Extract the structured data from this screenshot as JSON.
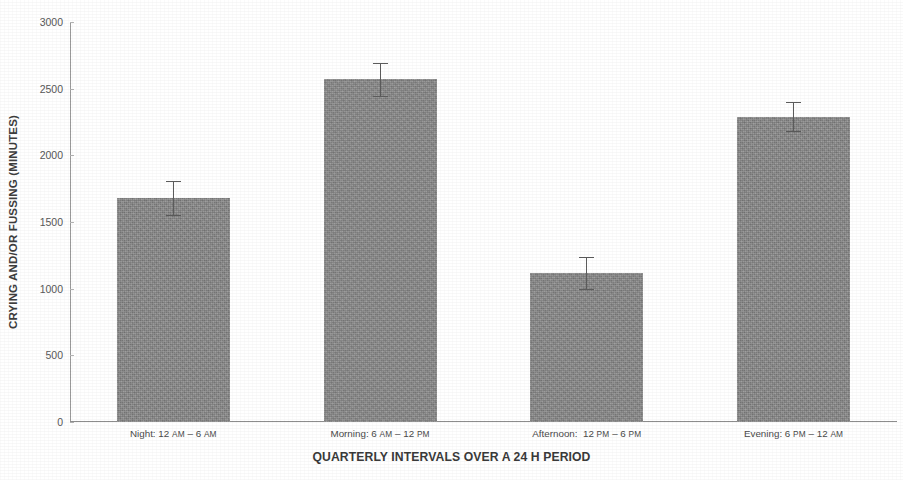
{
  "chart_data": {
    "type": "bar",
    "title": "",
    "xlabel": "QUARTERLY INTERVALS OVER A 24 H PERIOD",
    "ylabel": "CRYING AND/OR FUSSING (MINUTES)",
    "categories": [
      "Night: 12 AM – 6 AM",
      "Morning: 6 AM – 12 PM",
      "Afternoon:  12 PM – 6 PM",
      "Evening: 6 PM – 12 AM"
    ],
    "category_parts": [
      {
        "lead": "Night: 12 ",
        "u1": "AM",
        "mid": " – 6 ",
        "u2": "AM"
      },
      {
        "lead": "Morning: 6 ",
        "u1": "AM",
        "mid": " – 12 ",
        "u2": "PM"
      },
      {
        "lead": "Afternoon:  12 ",
        "u1": "PM",
        "mid": " – 6 ",
        "u2": "PM"
      },
      {
        "lead": "Evening: 6 ",
        "u1": "PM",
        "mid": " – 12 ",
        "u2": "AM"
      }
    ],
    "values": [
      1680,
      2570,
      1120,
      2290
    ],
    "errors": [
      125,
      125,
      120,
      110
    ],
    "ylim": [
      0,
      3000
    ],
    "yticks": [
      0,
      500,
      1000,
      1500,
      2000,
      2500,
      3000
    ],
    "ytick_labels": [
      "0",
      "500",
      "1000",
      "1500",
      "2000",
      "2500",
      "3000"
    ],
    "grid": false,
    "legend": null,
    "bar_color": "#8b8b8b",
    "error_color": "#5c5c5c",
    "axis_color": "#8d8d8d",
    "background": "#ffffff"
  }
}
